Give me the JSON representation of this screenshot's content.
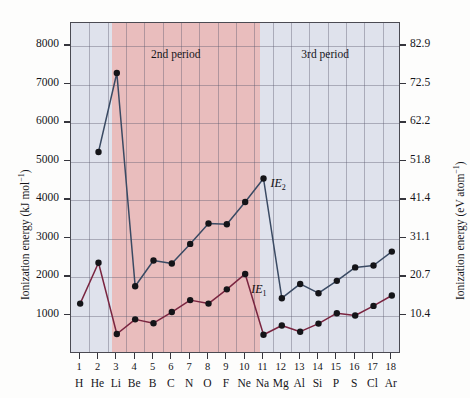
{
  "chart_data": {
    "type": "line",
    "title": "",
    "xlabel": "",
    "ylabel": "Ionization energy (kJ mol⁻¹)",
    "ylabel_right": "Ionization energy (eV atom⁻¹)",
    "grid": true,
    "ylim": [
      0,
      8600
    ],
    "categories": [
      1,
      2,
      3,
      4,
      5,
      6,
      7,
      8,
      9,
      10,
      11,
      12,
      13,
      14,
      15,
      16,
      17,
      18
    ],
    "element_symbols": [
      "H",
      "He",
      "Li",
      "Be",
      "B",
      "C",
      "N",
      "O",
      "F",
      "Ne",
      "Na",
      "Mg",
      "Al",
      "Si",
      "P",
      "S",
      "Cl",
      "Ar"
    ],
    "atomic_numbers": [
      "1",
      "2",
      "3",
      "4",
      "5",
      "6",
      "7",
      "8",
      "9",
      "10",
      "11",
      "12",
      "13",
      "14",
      "15",
      "16",
      "17",
      "18"
    ],
    "yticks_left": [
      "1000",
      "2000",
      "3000",
      "4000",
      "5000",
      "6000",
      "7000",
      "8000"
    ],
    "ytick_values_left": [
      1000,
      2000,
      3000,
      4000,
      5000,
      6000,
      7000,
      8000
    ],
    "yticks_right": [
      "10.4",
      "20.7",
      "31.1",
      "41.4",
      "51.8",
      "62.2",
      "72.5",
      "82.9"
    ],
    "ytick_values_right": [
      10.4,
      20.7,
      31.1,
      41.4,
      51.8,
      62.2,
      72.5,
      82.9
    ],
    "series": [
      {
        "name": "IE₁",
        "label": "IE",
        "label_sub": "1",
        "color": "#7a2540",
        "values": [
          1310,
          2370,
          520,
          900,
          800,
          1090,
          1400,
          1310,
          1680,
          2080,
          500,
          740,
          580,
          790,
          1060,
          1000,
          1250,
          1520
        ]
      },
      {
        "name": "IE₂",
        "label": "IE",
        "label_sub": "2",
        "color": "#3a4a63",
        "values": [
          null,
          5250,
          7300,
          1760,
          2430,
          2350,
          2860,
          3390,
          3370,
          3950,
          4560,
          1450,
          1820,
          1580,
          1900,
          2250,
          2300,
          2660
        ]
      }
    ],
    "annotations": [
      {
        "text": "2nd period",
        "x_center": 6.0,
        "y": 7750
      },
      {
        "text": "3rd period",
        "x_center": 14.2,
        "y": 7750
      }
    ],
    "bands": [
      {
        "label": "2nd period",
        "from": 2.5,
        "to": 10.5,
        "color": "#e9bdbd"
      },
      {
        "label": "1st/3rd period",
        "color": "#dfe2ec"
      }
    ],
    "background_color": "#dfe2ec",
    "band_color": "#e9bdbd"
  },
  "labels": {
    "period2": "2nd period",
    "period3": "3rd period",
    "ie1_main": "IE",
    "ie1_sub": "1",
    "ie2_main": "IE",
    "ie2_sub": "2",
    "axis_left_pre": "Ionization energy (kJ mol",
    "axis_left_sup": "−1",
    "axis_left_post": ")",
    "axis_right_pre": "Ionization energy (eV atom",
    "axis_right_sup": "−1",
    "axis_right_post": ")"
  }
}
